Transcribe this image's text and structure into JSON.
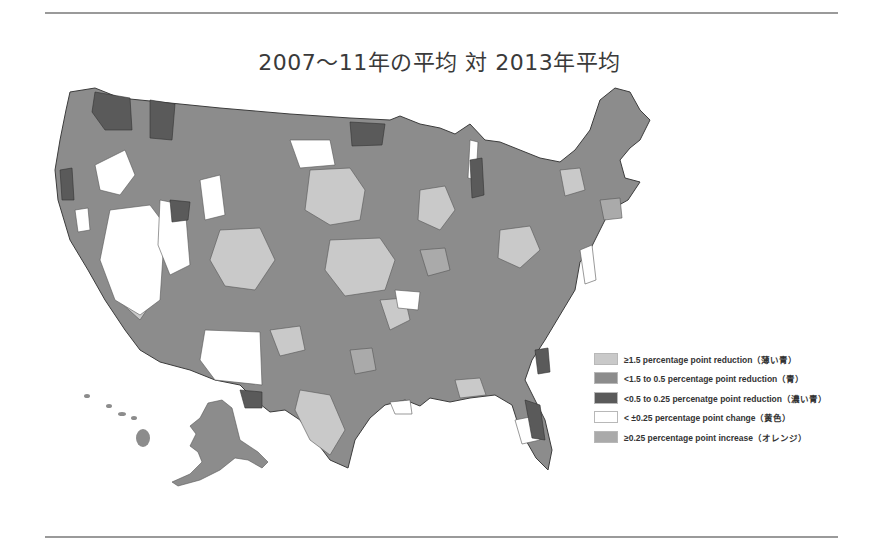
{
  "title": "2007～11年の平均 対 2013年平均",
  "colors": {
    "light": "#c9c9c9",
    "medium": "#8c8c8c",
    "dark": "#5a5a5a",
    "none": "#ffffff",
    "increase": "#aaaaaa",
    "border": "#3c3c3c",
    "rule": "#9a9a9a"
  },
  "legend": {
    "items": [
      {
        "label": "≥1.5 percentage point reduction（薄い青）",
        "color": "#c9c9c9"
      },
      {
        "label": "<1.5 to 0.5 percentage point reduction（青）",
        "color": "#8c8c8c"
      },
      {
        "label": "<0.5 to 0.25 percenatge point reduction（濃い青）",
        "color": "#5a5a5a"
      },
      {
        "label": "< ±0.25 percentage point change（黄色）",
        "color": "#ffffff"
      },
      {
        "label": "≥0.25 percentage point increase（オレンジ）",
        "color": "#aaaaaa"
      }
    ]
  }
}
